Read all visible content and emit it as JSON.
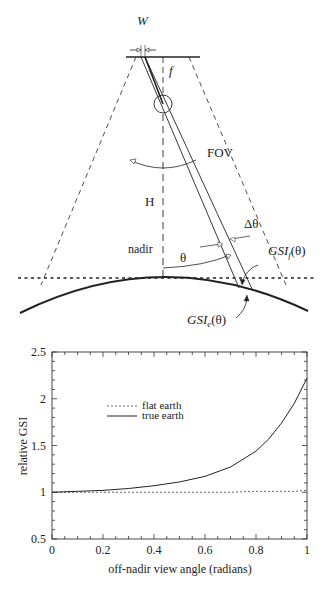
{
  "diagram": {
    "labels": {
      "w": "W",
      "f": "f",
      "fov": "FOV",
      "h": "H",
      "nadir": "nadir",
      "theta": "θ",
      "delta_theta": "Δθ",
      "gsi_f": "GSI",
      "gsi_f_sub": "f",
      "gsi_f_arg": "(θ)",
      "gsi_e": "GSI",
      "gsi_e_sub": "e",
      "gsi_e_arg": "(θ)"
    }
  },
  "chart_data": {
    "type": "line",
    "title": "",
    "xlabel": "off-nadir view angle (radians)",
    "ylabel": "relative GSI",
    "xlim": [
      0,
      1
    ],
    "ylim": [
      0.5,
      2.5
    ],
    "xticks": [
      "0",
      "0.2",
      "0.4",
      "0.6",
      "0.8",
      "1"
    ],
    "yticks": [
      "0.5",
      "1",
      "1.5",
      "2",
      "2.5"
    ],
    "legend_position": "upper-left-inside",
    "x": [
      0,
      0.1,
      0.2,
      0.3,
      0.4,
      0.5,
      0.6,
      0.7,
      0.8,
      0.85,
      0.9,
      0.95,
      1.0
    ],
    "series": [
      {
        "name": "flat earth",
        "style": "dotted",
        "values": [
          1,
          1,
          1,
          1,
          1,
          1,
          1,
          1,
          1.01,
          1.01,
          1.01,
          1.01,
          1.02
        ]
      },
      {
        "name": "true earth",
        "style": "solid",
        "values": [
          1,
          1.01,
          1.02,
          1.04,
          1.07,
          1.11,
          1.17,
          1.27,
          1.44,
          1.57,
          1.74,
          1.95,
          2.22
        ]
      }
    ]
  }
}
